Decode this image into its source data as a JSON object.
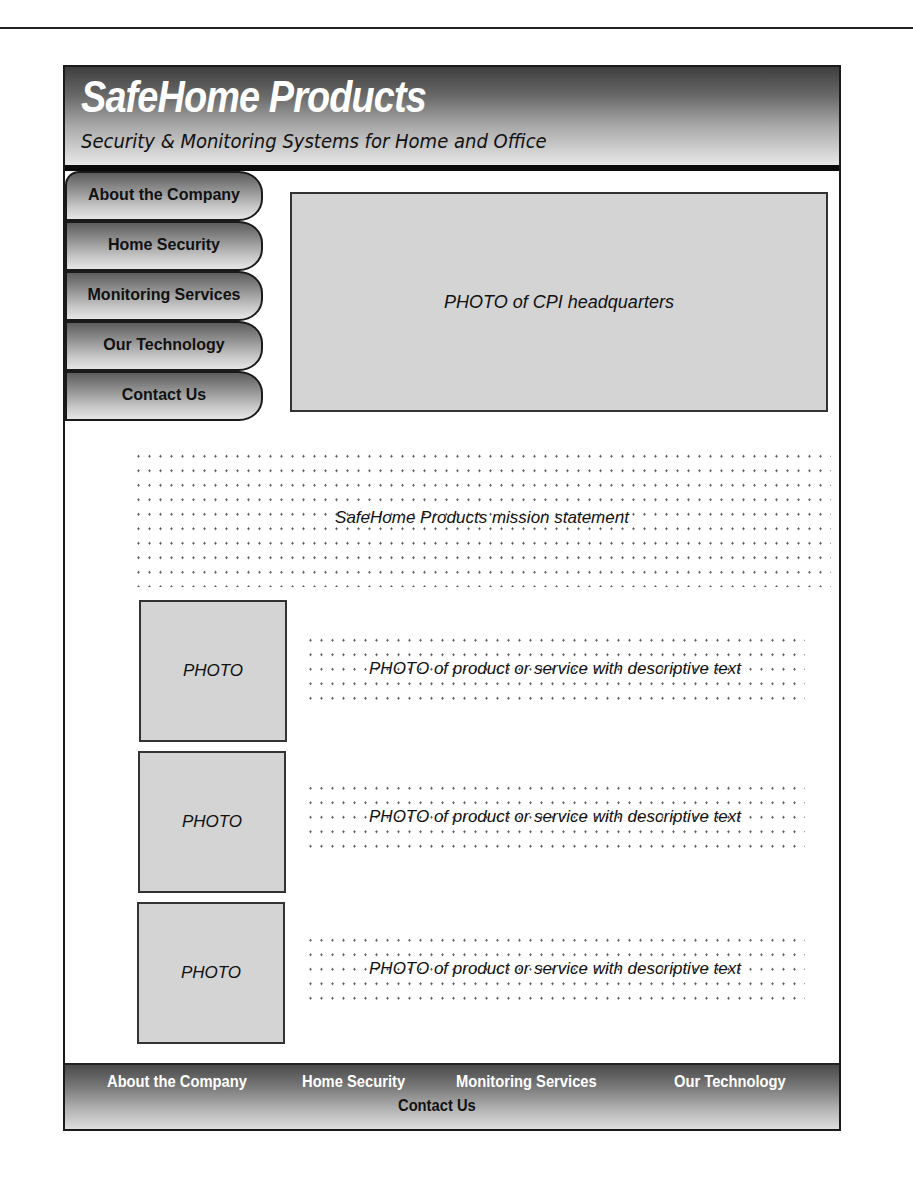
{
  "header": {
    "logo": "SafeHome Products",
    "tagline": "Security & Monitoring Systems for Home and Office"
  },
  "sidebar": {
    "items": [
      {
        "label": "About the Company"
      },
      {
        "label": "Home Security"
      },
      {
        "label": "Monitoring Services"
      },
      {
        "label": "Our Technology"
      },
      {
        "label": "Contact Us"
      }
    ]
  },
  "hero": {
    "label": "PHOTO of CPI headquarters"
  },
  "mission": {
    "label": "SafeHome Products mission statement"
  },
  "products": [
    {
      "photo": "PHOTO",
      "text": "PHOTO of product or service with descriptive text"
    },
    {
      "photo": "PHOTO",
      "text": "PHOTO of product or service with descriptive text"
    },
    {
      "photo": "PHOTO",
      "text": "PHOTO of product or service with descriptive text"
    }
  ],
  "footer": {
    "links": [
      {
        "label": "About the Company"
      },
      {
        "label": "Home Security"
      },
      {
        "label": "Monitoring Services"
      },
      {
        "label": "Our Technology"
      },
      {
        "label": "Contact Us"
      }
    ]
  }
}
